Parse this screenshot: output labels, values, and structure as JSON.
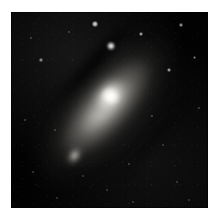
{
  "figure": {
    "kind": "astronomical-image",
    "caption": "",
    "background_color": "#ffffff",
    "sky_color": "#020202",
    "plate": {
      "x": 11,
      "y": 12,
      "width": 197,
      "height": 196
    }
  },
  "chart_data": {
    "type": "scatter",
    "title": "",
    "xlabel": "",
    "ylabel": "",
    "grid": false,
    "legend": "none",
    "xlim": [
      0,
      197
    ],
    "ylim": [
      0,
      196
    ],
    "objects": [
      {
        "name": "galaxy-nucleus",
        "type": "nucleus",
        "x": 99,
        "y": 84,
        "brightness": 1.0,
        "size": 19
      },
      {
        "name": "galaxy-bulge",
        "type": "bulge",
        "x": 99,
        "y": 84,
        "brightness": 0.82,
        "size": 46,
        "axis_ratio": 0.74,
        "position_angle": -48
      },
      {
        "name": "galaxy-disk-inner",
        "type": "disk",
        "x": 95,
        "y": 81,
        "brightness": 0.62,
        "size": 124,
        "axis_ratio": 0.39,
        "position_angle": -48
      },
      {
        "name": "galaxy-disk-mid",
        "type": "disk",
        "x": 95,
        "y": 80,
        "brightness": 0.45,
        "size": 188,
        "axis_ratio": 0.4,
        "position_angle": -48
      },
      {
        "name": "galaxy-disk-halo",
        "type": "halo",
        "x": 94,
        "y": 81,
        "brightness": 0.28,
        "size": 250,
        "axis_ratio": 0.47,
        "position_angle": -48
      },
      {
        "name": "dust-lane-upper",
        "type": "dust-lane",
        "x": 90,
        "y": 43,
        "length": 120,
        "position_angle": -48,
        "opacity": 0.8
      },
      {
        "name": "dust-lane-outer",
        "type": "dust-lane",
        "x": 68,
        "y": 66,
        "length": 104,
        "position_angle": -48,
        "opacity": 0.68
      },
      {
        "name": "dust-lane-lower",
        "type": "dust-lane",
        "x": 142,
        "y": 128,
        "length": 112,
        "position_angle": -48,
        "opacity": 0.45
      },
      {
        "name": "companion-galaxy",
        "type": "elliptical-galaxy",
        "x": 63,
        "y": 143,
        "brightness": 0.55,
        "size": 25,
        "axis_ratio": 0.68,
        "position_angle": -58
      }
    ],
    "stars": [
      {
        "x": 100,
        "y": 34,
        "brightness": 0.95,
        "size": 8.5
      },
      {
        "x": 84,
        "y": 12,
        "brightness": 0.58,
        "size": 6.0
      },
      {
        "x": 130,
        "y": 22,
        "brightness": 0.4,
        "size": 4.2
      },
      {
        "x": 170,
        "y": 13,
        "brightness": 0.34,
        "size": 3.6
      },
      {
        "x": 158,
        "y": 58,
        "brightness": 0.38,
        "size": 4.0
      },
      {
        "x": 183,
        "y": 45,
        "brightness": 0.26,
        "size": 3.0
      },
      {
        "x": 188,
        "y": 96,
        "brightness": 0.22,
        "size": 2.6
      },
      {
        "x": 141,
        "y": 104,
        "brightness": 0.24,
        "size": 2.6
      },
      {
        "x": 152,
        "y": 133,
        "brightness": 0.2,
        "size": 2.4
      },
      {
        "x": 118,
        "y": 152,
        "brightness": 0.22,
        "size": 2.6
      },
      {
        "x": 166,
        "y": 170,
        "brightness": 0.18,
        "size": 2.2
      },
      {
        "x": 96,
        "y": 178,
        "brightness": 0.18,
        "size": 2.2
      },
      {
        "x": 46,
        "y": 186,
        "brightness": 0.16,
        "size": 2.2
      },
      {
        "x": 22,
        "y": 160,
        "brightness": 0.2,
        "size": 2.4
      },
      {
        "x": 14,
        "y": 108,
        "brightness": 0.22,
        "size": 2.6
      },
      {
        "x": 30,
        "y": 48,
        "brightness": 0.3,
        "size": 3.2
      },
      {
        "x": 20,
        "y": 26,
        "brightness": 0.24,
        "size": 2.6
      },
      {
        "x": 58,
        "y": 20,
        "brightness": 0.22,
        "size": 2.4
      },
      {
        "x": 72,
        "y": 164,
        "brightness": 0.18,
        "size": 2.2
      },
      {
        "x": 178,
        "y": 188,
        "brightness": 0.16,
        "size": 2.0
      },
      {
        "x": 122,
        "y": 190,
        "brightness": 0.16,
        "size": 2.0
      },
      {
        "x": 44,
        "y": 118,
        "brightness": 0.18,
        "size": 2.2
      }
    ]
  }
}
